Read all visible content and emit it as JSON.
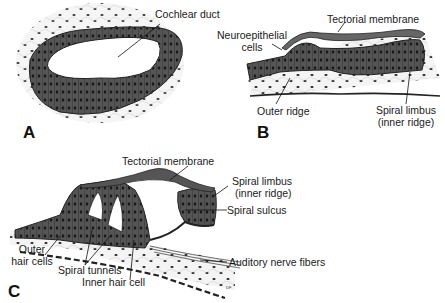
{
  "figure": {
    "panels": [
      {
        "id": "A",
        "panel_label": "A",
        "labels": {
          "cochlear_duct": "Cochlear duct"
        }
      },
      {
        "id": "B",
        "panel_label": "B",
        "labels": {
          "tectorial_membrane": "Tectorial membrane",
          "neuroepithelial_cells_line1": "Neuroepithelial",
          "neuroepithelial_cells_line2": "cells",
          "outer_ridge": "Outer ridge",
          "spiral_limbus_line1": "Spiral limbus",
          "spiral_limbus_line2": "(inner ridge)"
        }
      },
      {
        "id": "C",
        "panel_label": "C",
        "labels": {
          "tectorial_membrane": "Tectorial membrane",
          "spiral_limbus_line1": "Spiral limbus",
          "spiral_limbus_line2": "(inner ridge)",
          "spiral_sulcus": "Spiral sulcus",
          "outer_hair_cells_line1": "Outer",
          "outer_hair_cells_line2": "hair cells",
          "spiral_tunnels": "Spiral tunnels",
          "inner_hair_cell": "Inner hair cell",
          "auditory_nerve_fibers": "Auditory nerve fibers"
        },
        "signature": "DF"
      }
    ],
    "colors": {
      "tissue": "#4a4a4a",
      "tissue_light": "#7a7a7a",
      "line": "#111111",
      "background": "#ffffff"
    }
  }
}
